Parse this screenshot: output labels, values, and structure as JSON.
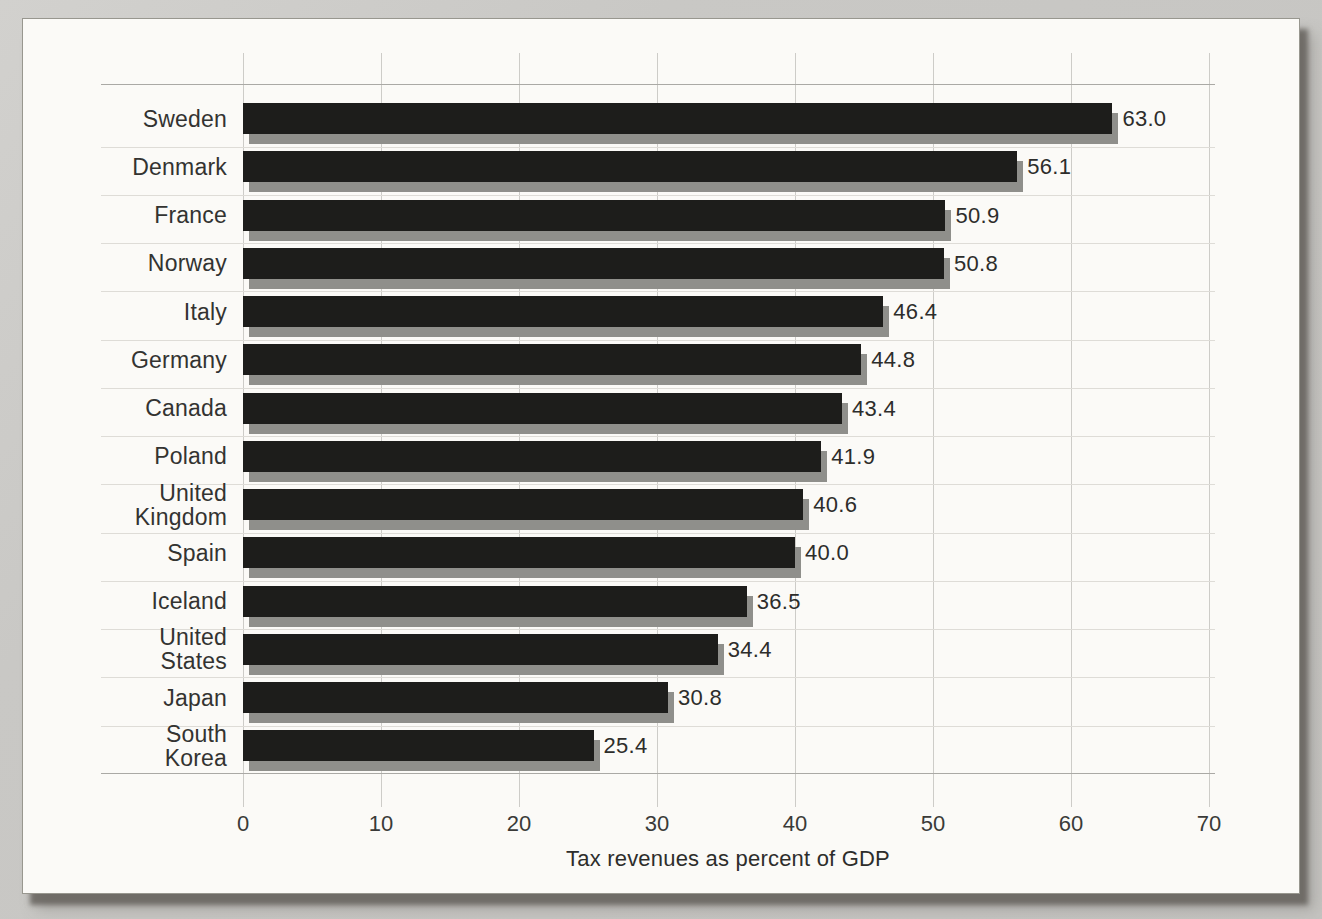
{
  "figure": {
    "page_background_color": "#c9c8c5",
    "panel_color": "#fbfaf7",
    "bar_color": "#1d1d1b",
    "bar_shadow_color": "#8f8f8b",
    "gridline_color": "#cdccc8",
    "axis_line_color": "#aaa9a5",
    "row_separator_color": "#dedcd7",
    "text_color": "#2d2d2b"
  },
  "chart_data": {
    "type": "bar",
    "orientation": "horizontal",
    "title": "",
    "xlabel": "Tax revenues as percent of GDP",
    "ylabel": "",
    "xlim": [
      0,
      70
    ],
    "xticks": [
      "0",
      "10",
      "20",
      "30",
      "40",
      "50",
      "60",
      "70"
    ],
    "grid": true,
    "legend": false,
    "categories": [
      "Sweden",
      "Denmark",
      "France",
      "Norway",
      "Italy",
      "Germany",
      "Canada",
      "Poland",
      "United Kingdom",
      "Spain",
      "Iceland",
      "United States",
      "Japan",
      "South Korea"
    ],
    "display_labels": [
      "Sweden",
      "Denmark",
      "France",
      "Norway",
      "Italy",
      "Germany",
      "Canada",
      "Poland",
      "United\nKingdom",
      "Spain",
      "Iceland",
      "United\nStates",
      "Japan",
      "South\nKorea"
    ],
    "values": [
      63.0,
      56.1,
      50.9,
      50.8,
      46.4,
      44.8,
      43.4,
      41.9,
      40.6,
      40.0,
      36.5,
      34.4,
      30.8,
      25.4
    ],
    "value_labels": [
      "63.0",
      "56.1",
      "50.9",
      "50.8",
      "46.4",
      "44.8",
      "43.4",
      "41.9",
      "40.6",
      "40.0",
      "36.5",
      "34.4",
      "30.8",
      "25.4"
    ]
  }
}
